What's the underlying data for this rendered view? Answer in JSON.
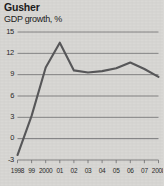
{
  "figure": {
    "title": "Gusher",
    "subtitle": "GDP growth, %",
    "background_color": "#d9d8d5",
    "line_color": "#58585a",
    "grid_color": "#6e6e70",
    "text_color": "#1c1c1c"
  },
  "chart_data": {
    "type": "line",
    "title": "Gusher",
    "subtitle": "GDP growth, %",
    "xlabel": "",
    "ylabel": "GDP growth, %",
    "categories": [
      "1998",
      "99",
      "2000",
      "01",
      "02",
      "03",
      "04",
      "05",
      "06",
      "07",
      "2008"
    ],
    "values": [
      -2.3,
      3.2,
      10.0,
      13.5,
      9.6,
      9.3,
      9.5,
      9.9,
      10.7,
      9.8,
      8.7
    ],
    "ylim": [
      -3,
      15
    ],
    "yticks": [
      15,
      12,
      9,
      6,
      3,
      0,
      -3
    ],
    "ytick_labels": [
      "15",
      "12",
      "9",
      "6",
      "3",
      "0",
      "-3"
    ],
    "xtick_labels": [
      "1998",
      "99",
      "2000",
      "01",
      "02",
      "03",
      "04",
      "05",
      "06",
      "07",
      "2008"
    ],
    "grid": "horizontal",
    "legend": "none"
  }
}
